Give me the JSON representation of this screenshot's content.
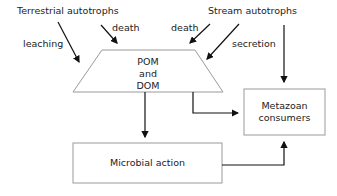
{
  "diagram": {
    "sources": {
      "terrestrial": "Terrestrial autotrophs",
      "stream": "Stream autotrophs"
    },
    "edge_labels": {
      "leaching": "leaching",
      "terr_death": "death",
      "stream_death": "death",
      "secretion": "secretion"
    },
    "nodes": {
      "pool": [
        "POM",
        "and",
        "DOM"
      ],
      "metazoan": [
        "Metazoan",
        "consumers"
      ],
      "microbial": "Microbial action"
    },
    "colors": {
      "stroke": "#999999",
      "arrow": "#111111",
      "text": "#222222"
    }
  }
}
